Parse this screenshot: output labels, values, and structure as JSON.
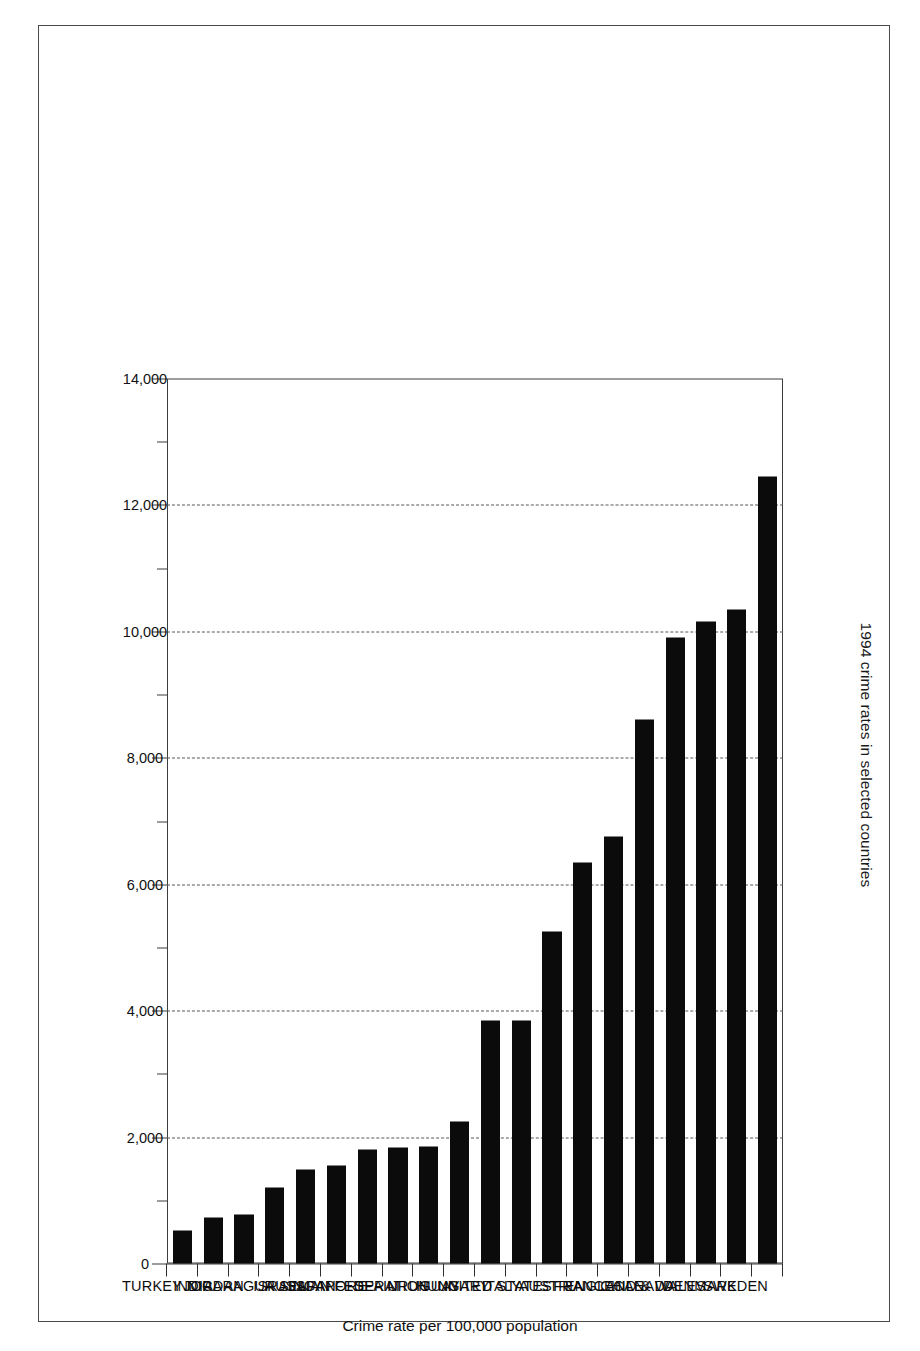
{
  "chart_data": {
    "type": "bar",
    "orientation": "vertical-rotated",
    "title": "1994 crime rates in selected countries",
    "xlabel": "",
    "ylabel": "Crime rate per 100,000 population",
    "ylim": [
      0,
      14000
    ],
    "ytick_step": 2000,
    "yminor_step": 1000,
    "grid": "dashed horizontal gridlines at major ticks",
    "legend": "none",
    "categories": [
      "SWEDEN",
      "DENMARK",
      "ENGLAND & WALES",
      "CANADA",
      "CHILE",
      "FRANCE",
      "AUSTRIA",
      "UNITED STATES",
      "ITALY",
      "HUNGARY",
      "URUGUAY",
      "RUSSIAN FEDERATION",
      "SPAIN",
      "SINGAPORE",
      "JAPAN",
      "ISRAEL",
      "NICARAGUA",
      "JORDAN",
      "INDIA",
      "TURKEY"
    ],
    "values": [
      12450,
      10350,
      10150,
      9900,
      8600,
      6750,
      6350,
      5250,
      3850,
      3850,
      2250,
      1850,
      1830,
      1800,
      1550,
      1480,
      1200,
      780,
      720,
      520
    ],
    "tick_labels": [
      "0",
      "2,000",
      "4,000",
      "6,000",
      "8,000",
      "10,000",
      "12,000",
      "14,000"
    ],
    "tick_values": [
      0,
      2000,
      4000,
      6000,
      8000,
      10000,
      12000,
      14000
    ],
    "bar_color": "#0b0b0b",
    "gridline_color": "#55565a",
    "axis_color": "#3a3a3a",
    "frame_color": "#4a4a4a"
  }
}
